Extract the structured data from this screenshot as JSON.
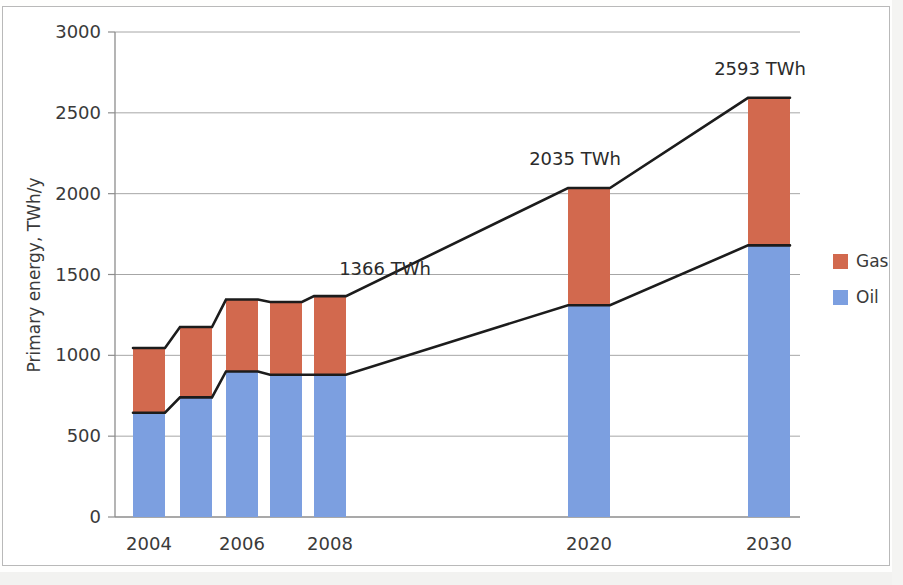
{
  "chart_data": {
    "type": "bar",
    "subtype": "stacked-bar",
    "title": "",
    "xlabel": "",
    "ylabel": "Primary energy, TWh/y",
    "ylim": [
      0,
      3000
    ],
    "ytick_labels": [
      "0",
      "500",
      "1000",
      "1500",
      "2000",
      "2500",
      "3000"
    ],
    "ytick_values": [
      0,
      500,
      1000,
      1500,
      2000,
      2500,
      3000
    ],
    "grid": true,
    "grid_axis": "y",
    "legend_position": "right",
    "categories": [
      "2004",
      "2005",
      "2006",
      "2007",
      "2008",
      "2020",
      "2030"
    ],
    "x_tick_labels": [
      "2004",
      "",
      "2006",
      "",
      "2008",
      "2020",
      "2030"
    ],
    "series": [
      {
        "name": "Oil",
        "color": "#7c9fe0",
        "values": [
          645,
          740,
          900,
          880,
          880,
          1310,
          1680
        ]
      },
      {
        "name": "Gas",
        "color": "#d2694e",
        "values": [
          400,
          435,
          445,
          450,
          486,
          725,
          913
        ]
      }
    ],
    "totals": [
      1045,
      1175,
      1345,
      1330,
      1366,
      2035,
      2593
    ],
    "annotations": [
      {
        "text": "1366 TWh",
        "category": "2008",
        "value": 1366
      },
      {
        "text": "2035 TWh",
        "category": "2020",
        "value": 2035
      },
      {
        "text": "2593 TWh",
        "category": "2030",
        "value": 2593
      }
    ],
    "connector_lines": [
      {
        "name": "total-top-connector",
        "points": "2004-top to 2030-top"
      },
      {
        "name": "oil-top-connector",
        "points": "2004-oil-top to 2030-oil-top"
      }
    ]
  },
  "legend": {
    "items": [
      {
        "label": "Gas",
        "color": "#d2694e"
      },
      {
        "label": "Oil",
        "color": "#7c9fe0"
      }
    ]
  },
  "axes": {
    "y_title": "Primary energy, TWh/y"
  }
}
